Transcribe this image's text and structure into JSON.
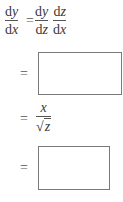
{
  "line1": {
    "lhs": {
      "num_d": "d",
      "num_v": "y",
      "den_d": "d",
      "den_v": "x"
    },
    "equals": "=",
    "rhs1": {
      "num_d": "d",
      "num_v": "y",
      "den_d": "d",
      "den_v": "z"
    },
    "rhs2": {
      "num_d": "d",
      "num_v": "z",
      "den_d": "d",
      "den_v": "x"
    }
  },
  "line2": {
    "equals": "=",
    "answer_box": ""
  },
  "line3": {
    "equals": "=",
    "numerator": "x",
    "radical": "√",
    "radicand": "z"
  },
  "line4": {
    "equals": "=",
    "answer_box": ""
  }
}
